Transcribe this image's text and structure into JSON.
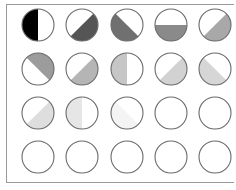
{
  "grid": {
    "rows": 4,
    "cols": 5,
    "col_centers": [
      38,
      82,
      127,
      171,
      215
    ],
    "row_centers": [
      25,
      69,
      113,
      157
    ],
    "radius": 16,
    "stroke_color": "#6a6a6a",
    "cells": [
      {
        "fill": "#000000",
        "region": "left"
      },
      {
        "fill": "#555555",
        "region": "bottom-right"
      },
      {
        "fill": "#707070",
        "region": "bottom-left"
      },
      {
        "fill": "#8a8a8a",
        "region": "bottom"
      },
      {
        "fill": "#a8a8a8",
        "region": "bottom-right"
      },
      {
        "fill": "#9c9c9c",
        "region": "top-right"
      },
      {
        "fill": "#b5b5b5",
        "region": "bottom-right"
      },
      {
        "fill": "#c6c6c6",
        "region": "left"
      },
      {
        "fill": "#d2d2d2",
        "region": "bottom-right"
      },
      {
        "fill": "#d6d6d6",
        "region": "bottom-left"
      },
      {
        "fill": "#dedede",
        "region": "bottom-right"
      },
      {
        "fill": "#e6e6e6",
        "region": "left"
      },
      {
        "fill": "#f4f4f4",
        "region": "bottom-left"
      },
      {
        "fill": "none",
        "region": "none"
      },
      {
        "fill": "none",
        "region": "none"
      },
      {
        "fill": "none",
        "region": "none"
      },
      {
        "fill": "none",
        "region": "none"
      },
      {
        "fill": "none",
        "region": "none"
      },
      {
        "fill": "none",
        "region": "none"
      },
      {
        "fill": "none",
        "region": "none"
      }
    ]
  }
}
